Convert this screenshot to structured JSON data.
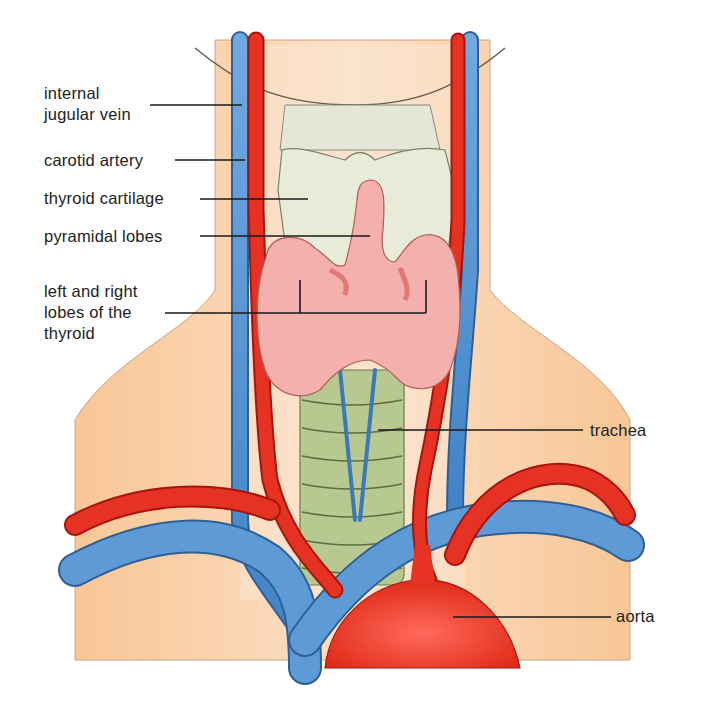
{
  "diagram": {
    "labels": {
      "internal_jugular_vein": "internal\njugular vein",
      "carotid_artery": "carotid artery",
      "thyroid_cartilage": "thyroid cartilage",
      "pyramidal_lobes": "pyramidal lobes",
      "thyroid_lobes": "left and right\nlobes of the\nthyroid",
      "trachea": "trachea",
      "aorta": "aorta"
    },
    "colors": {
      "skin": "#f9cfa4",
      "skin_light": "#fbe3cc",
      "vein": "#4a8fd0",
      "artery": "#e53222",
      "thyroid": "#f2a9a6",
      "cartilage": "#e6ebd6",
      "trachea": "#a9bd82",
      "leader_line": "#1a1a1a"
    }
  }
}
